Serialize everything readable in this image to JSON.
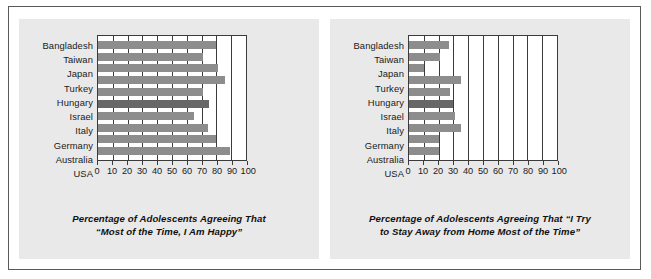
{
  "figure": {
    "frame_color": "#5a5a5a",
    "panel_background": "#e9e9e9",
    "bar_color": "#8d8d8d",
    "highlight_bar_color": "#676767"
  },
  "chart_data": [
    {
      "type": "bar",
      "orientation": "horizontal",
      "title": "",
      "xlabel": "Percentage of Adolescents Agreeing That “Most of the Time, I Am Happy”",
      "caption_line1": "Percentage of Adolescents Agreeing That",
      "caption_line2": "“Most of the Time, I Am Happy”",
      "ylabel": "",
      "categories": [
        "Bangladesh",
        "Taiwan",
        "Japan",
        "Turkey",
        "Hungary",
        "Israel",
        "Italy",
        "Germany",
        "Australia",
        "USA"
      ],
      "values": [
        80,
        71,
        81,
        86,
        71,
        75,
        65,
        74,
        80,
        89
      ],
      "highlight_category": "Israel",
      "xlim": [
        0,
        100
      ],
      "ticks": [
        0,
        10,
        20,
        30,
        40,
        50,
        60,
        70,
        80,
        90,
        100
      ],
      "tick_labels": [
        "0",
        "10",
        "20",
        "30",
        "40",
        "50",
        "60",
        "70",
        "80",
        "90",
        "100"
      ],
      "grid": true,
      "legend": "none"
    },
    {
      "type": "bar",
      "orientation": "horizontal",
      "title": "",
      "xlabel": "Percentage of Adolescents Agreeing That “I Try to Stay Away from Home Most of the Time”",
      "caption_line1": "Percentage of Adolescents Agreeing That “I Try",
      "caption_line2": "to Stay Away from Home Most of the Time”",
      "ylabel": "",
      "categories": [
        "Bangladesh",
        "Taiwan",
        "Japan",
        "Turkey",
        "Hungary",
        "Israel",
        "Italy",
        "Germany",
        "Australia",
        "USA"
      ],
      "values": [
        27,
        21,
        10,
        35,
        28,
        30,
        31,
        35,
        20,
        20
      ],
      "highlight_category": "Israel",
      "xlim": [
        0,
        100
      ],
      "ticks": [
        0,
        10,
        20,
        30,
        40,
        50,
        60,
        70,
        80,
        90,
        100
      ],
      "tick_labels": [
        "0",
        "10",
        "20",
        "30",
        "40",
        "50",
        "60",
        "70",
        "80",
        "90",
        "100"
      ],
      "grid": true,
      "legend": "none"
    }
  ]
}
